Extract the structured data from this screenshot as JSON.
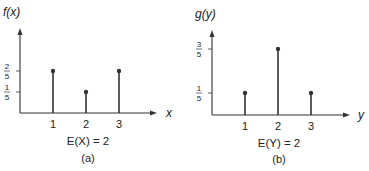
{
  "chart_data": [
    {
      "type": "stem",
      "title": "",
      "ylabel": "f(x)",
      "xlabel": "x",
      "x": [
        1,
        2,
        3
      ],
      "values": [
        0.4,
        0.2,
        0.4
      ],
      "xticks": [
        "1",
        "2",
        "3"
      ],
      "yticks": [
        {
          "value": 0.2,
          "num": "1",
          "den": "5"
        },
        {
          "value": 0.4,
          "num": "2",
          "den": "5"
        }
      ],
      "annotation": "E(X) = 2",
      "caption": "(a)"
    },
    {
      "type": "stem",
      "title": "",
      "ylabel": "g(y)",
      "xlabel": "y",
      "x": [
        1,
        2,
        3
      ],
      "values": [
        0.2,
        0.6,
        0.2
      ],
      "xticks": [
        "1",
        "2",
        "3"
      ],
      "yticks": [
        {
          "value": 0.2,
          "num": "1",
          "den": "5"
        },
        {
          "value": 0.6,
          "num": "3",
          "den": "5"
        }
      ],
      "annotation": "E(Y) = 2",
      "caption": "(b)"
    }
  ]
}
